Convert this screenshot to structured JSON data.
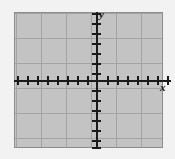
{
  "figure": {
    "kind": "blank-cartesian-coordinate-grid",
    "background_color": "#f2f2f2",
    "plot_background_color": "#ffffff",
    "frame_color": "#8d8d8d",
    "axis_color": "#1a1a1a",
    "minor_grid_color": "#b9b9b9",
    "major_grid_color": "#a3a3a3"
  },
  "axes": {
    "x_label": "x",
    "y_label": "y"
  },
  "chart_data": {
    "type": "scatter",
    "title": "",
    "xlabel": "x",
    "ylabel": "y",
    "series": [],
    "x": [],
    "values": [],
    "xlim": [
      -8,
      7
    ],
    "ylim": [
      -7,
      8
    ],
    "x_major_ticks": [
      -8,
      -6,
      -4,
      -2,
      0,
      2,
      4,
      6
    ],
    "y_major_ticks": [
      -6,
      -4,
      -2,
      0,
      2,
      4,
      6,
      8
    ],
    "x_tick_labels": [],
    "y_tick_labels": [],
    "tick_interval": 1,
    "major_grid_interval": 5,
    "minor_grid_interval": 1,
    "grid": true,
    "minor_grid": true,
    "legend": false,
    "legend_position": "none",
    "annotations": [],
    "note": "Empty graph paper: axes drawn with unlabeled unit tick marks, no plotted data."
  },
  "geometry": {
    "plot_left": 14,
    "plot_top": 12,
    "plot_width": 149,
    "plot_height": 136,
    "origin_x": 97,
    "origin_y": 81,
    "tick_spacing_px": 10,
    "major_grid_spacing_px": 25,
    "minor_grid_spacing_px": 5,
    "x_tick_offsets": [
      -80,
      -70,
      -60,
      -50,
      -40,
      -30,
      -20,
      -10,
      10,
      20,
      30,
      40,
      50,
      60,
      70
    ],
    "y_tick_offsets": [
      -68,
      -58,
      -48,
      -38,
      -28,
      -18,
      -8,
      9,
      19,
      29,
      39,
      49,
      59,
      66
    ],
    "x_major_offsets": [
      -82,
      -57,
      -32,
      -7,
      18,
      43,
      68
    ],
    "y_major_offsets": [
      -69,
      -44,
      -19,
      6,
      31,
      56
    ]
  }
}
